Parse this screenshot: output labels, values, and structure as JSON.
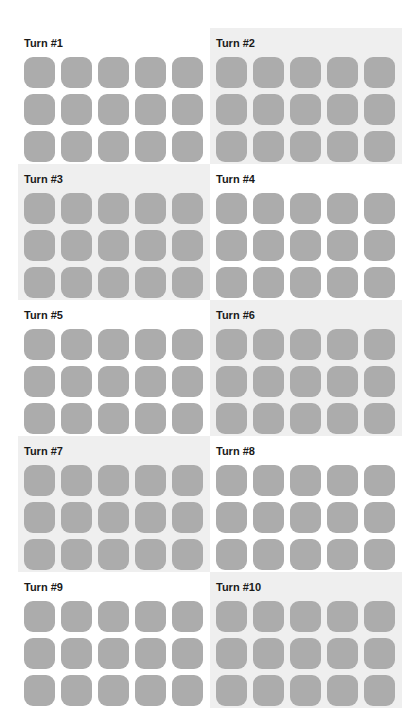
{
  "colors": {
    "tile": "#acacac",
    "panel_shaded": "#efefef",
    "panel_plain": "#ffffff",
    "title_text": "#1a1a1a"
  },
  "tile_grid": {
    "rows": 3,
    "cols": 5
  },
  "panels": [
    {
      "title": "Turn #1",
      "shaded": false
    },
    {
      "title": "Turn #2",
      "shaded": true
    },
    {
      "title": "Turn #3",
      "shaded": true
    },
    {
      "title": "Turn #4",
      "shaded": false
    },
    {
      "title": "Turn #5",
      "shaded": false
    },
    {
      "title": "Turn #6",
      "shaded": true
    },
    {
      "title": "Turn #7",
      "shaded": true
    },
    {
      "title": "Turn #8",
      "shaded": false
    },
    {
      "title": "Turn #9",
      "shaded": false
    },
    {
      "title": "Turn #10",
      "shaded": true
    }
  ]
}
